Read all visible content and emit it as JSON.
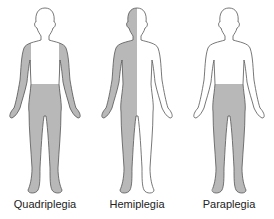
{
  "colors": {
    "shade": "#b8b8b8",
    "outline": "#555555",
    "background": "#ffffff"
  },
  "figures": [
    {
      "label": "Quadriplegia",
      "shaded_regions": [
        "arms",
        "legs",
        "lower-trunk"
      ]
    },
    {
      "label": "Hemiplegia",
      "shaded_regions": [
        "left-half"
      ]
    },
    {
      "label": "Paraplegia",
      "shaded_regions": [
        "legs",
        "lower-trunk"
      ]
    }
  ]
}
